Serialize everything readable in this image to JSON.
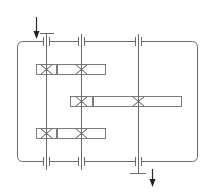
{
  "diagram": {
    "type": "gearbox-kinematic-schematic",
    "colors": {
      "line": "#6b6b6b",
      "arrow": "#222222",
      "background": "#ffffff"
    },
    "housing": {
      "x": 17,
      "y": 41,
      "width": 181,
      "height": 121,
      "corner_radius": 5
    },
    "shafts": [
      {
        "id": "shaft-1",
        "x": 46,
        "y_top": 34,
        "y_bottom": 170
      },
      {
        "id": "shaft-2",
        "x": 81,
        "y_top": 34,
        "y_bottom": 170
      },
      {
        "id": "shaft-3",
        "x": 138,
        "y_top": 34,
        "y_bottom": 173
      }
    ],
    "bearings": [
      {
        "shaft": "shaft-1",
        "position": "top",
        "y": 41
      },
      {
        "shaft": "shaft-2",
        "position": "top",
        "y": 41
      },
      {
        "shaft": "shaft-3",
        "position": "top",
        "y": 41
      },
      {
        "shaft": "shaft-1",
        "position": "bottom",
        "y": 162
      },
      {
        "shaft": "shaft-2",
        "position": "bottom",
        "y": 162
      },
      {
        "shaft": "shaft-3",
        "position": "bottom",
        "y": 162
      }
    ],
    "gear_rows": [
      {
        "id": "gear-row-1",
        "y": 64,
        "height": 11,
        "gears": [
          {
            "x": 36,
            "w": 21,
            "shaft_x": 46
          },
          {
            "x": 57,
            "w": 49,
            "shaft_x": 81
          }
        ]
      },
      {
        "id": "gear-row-2",
        "y": 96,
        "height": 11,
        "gears": [
          {
            "x": 70,
            "w": 23,
            "shaft_x": 81
          },
          {
            "x": 93,
            "w": 89,
            "shaft_x": 138
          }
        ]
      },
      {
        "id": "gear-row-3",
        "y": 128,
        "height": 11,
        "gears": [
          {
            "x": 36,
            "w": 21,
            "shaft_x": 46
          },
          {
            "x": 57,
            "w": 49,
            "shaft_x": 81
          }
        ]
      }
    ],
    "input": {
      "label": "input",
      "arrow_x": 36,
      "arrow_y1": 17,
      "arrow_y2": 39,
      "tbar_y": 34,
      "tbar_x1": 40,
      "tbar_x2": 54
    },
    "output": {
      "label": "output",
      "arrow_x": 152,
      "arrow_y1": 169,
      "arrow_y2": 186,
      "tbar_y": 173,
      "tbar_x1": 130,
      "tbar_x2": 146
    }
  }
}
